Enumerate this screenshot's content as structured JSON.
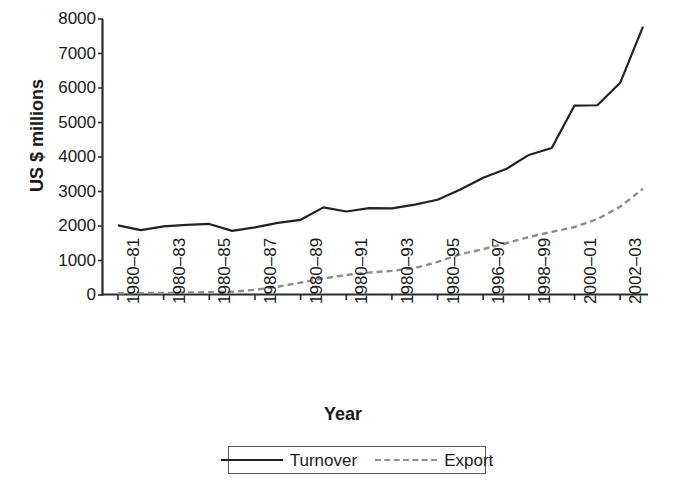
{
  "chart_data": {
    "type": "line",
    "title": "",
    "xlabel": "Year",
    "ylabel": "US $ millions",
    "ylim": [
      0,
      8000
    ],
    "ytick_values": [
      0,
      1000,
      2000,
      3000,
      4000,
      5000,
      6000,
      7000,
      8000
    ],
    "ytick_labels": [
      "8000",
      "7000",
      "6000",
      "5000",
      "4000",
      "3000",
      "2000",
      "1000",
      "0"
    ],
    "grid": false,
    "legend_position": "bottom-center",
    "categories": [
      "1980–81",
      "1981–82",
      "1980–83",
      "1983–84",
      "1980–85",
      "1985–86",
      "1980–87",
      "1987–88",
      "1980–89",
      "1989–90",
      "1980–91",
      "1991–92",
      "1980–93",
      "1993–94",
      "1980–95",
      "1995–96",
      "1996–97",
      "1997–98",
      "1998–99",
      "1999–00",
      "2000–01",
      "2001–02",
      "2002–03",
      "2003–04"
    ],
    "xtick_labels": [
      "1980–81",
      "1980–83",
      "1980–85",
      "1980–87",
      "1980–89",
      "1980–91",
      "1980–93",
      "1980–95",
      "1996–97",
      "1998–99",
      "2000–01",
      "2002–03"
    ],
    "series": [
      {
        "name": "Turnover",
        "style": "solid",
        "color": "#222222",
        "values": [
          2020,
          1880,
          1990,
          2030,
          2060,
          1860,
          1960,
          2090,
          2180,
          2540,
          2420,
          2520,
          2510,
          2620,
          2760,
          3060,
          3400,
          3650,
          4060,
          4260,
          5490,
          5500,
          6150,
          7780
        ]
      },
      {
        "name": "Export",
        "style": "dashed",
        "color": "#8d8d8d",
        "values": [
          50,
          55,
          60,
          70,
          80,
          95,
          150,
          240,
          360,
          480,
          580,
          650,
          700,
          780,
          960,
          1180,
          1330,
          1500,
          1680,
          1830,
          1970,
          2200,
          2560,
          3080
        ]
      }
    ]
  },
  "legend": {
    "entries": [
      {
        "label": "Turnover"
      },
      {
        "label": "Export"
      }
    ]
  },
  "axes": {
    "x_title": "Year",
    "y_title": "US $ millions"
  },
  "colors": {
    "turnover": "#222222",
    "export": "#8d8d8d",
    "axis": "#2b2b2b",
    "background": "#ffffff"
  }
}
